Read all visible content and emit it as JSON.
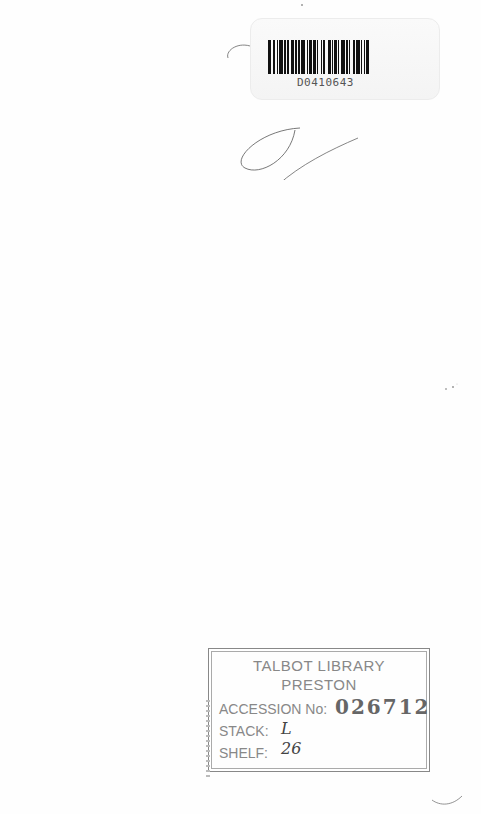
{
  "barcode": {
    "number": "D0410643",
    "bar_pattern": [
      3,
      1,
      2,
      2,
      1,
      1,
      3,
      1,
      2,
      1,
      1,
      2,
      3,
      1,
      1,
      1,
      2,
      1,
      3,
      2,
      1,
      1,
      2,
      1,
      3,
      1,
      1,
      2,
      1,
      1,
      2,
      2,
      3,
      1,
      1,
      1,
      2,
      1,
      1,
      2,
      3,
      1,
      2,
      1,
      1,
      2,
      2,
      1,
      3,
      1,
      1,
      2,
      1,
      1,
      2,
      1
    ]
  },
  "stamp": {
    "title_line1": "TALBOT LIBRARY",
    "title_line2": "PRESTON",
    "accession_label": "ACCESSION No:",
    "accession_value": "026712",
    "stack_label": "STACK:",
    "stack_value": "L",
    "shelf_label": "SHELF:",
    "shelf_value": "26"
  },
  "colors": {
    "page": "#fefefe",
    "ink": "#888888",
    "bar": "#111111"
  }
}
